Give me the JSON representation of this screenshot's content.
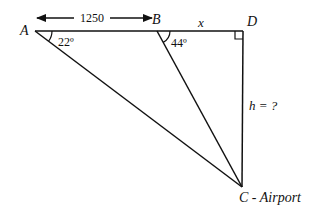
{
  "diagram": {
    "points": {
      "A": {
        "label": "A"
      },
      "B": {
        "label": "B"
      },
      "D": {
        "label": "D"
      },
      "C": {
        "label": "C - Airport"
      }
    },
    "measure_AB": "1250",
    "segment_BD": "x",
    "height_DC": "h = ?",
    "angle_A": "22º",
    "angle_B": "44º",
    "colors": {
      "line": "#111111",
      "background": "#ffffff"
    }
  }
}
